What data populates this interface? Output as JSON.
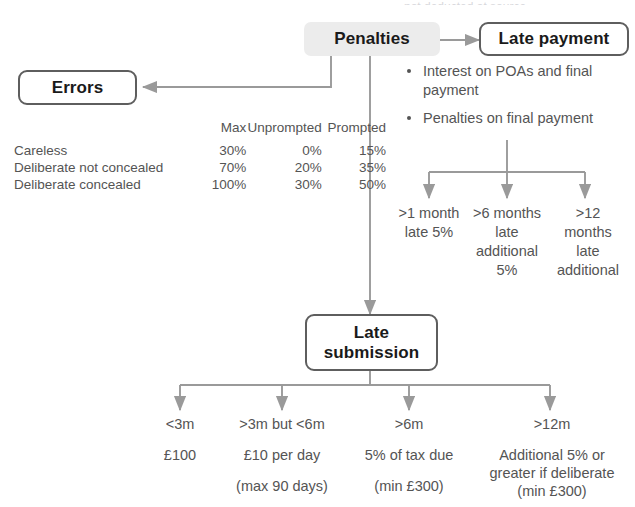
{
  "diagram": {
    "title": "Penalties",
    "cut_off_top_text": "not deducted at source",
    "nodes": {
      "penalties": {
        "label": "Penalties",
        "style": "filled",
        "fill": "#ececec"
      },
      "late_payment": {
        "label": "Late payment",
        "style": "outlined"
      },
      "errors": {
        "label": "Errors",
        "style": "outlined"
      },
      "late_submission": {
        "label": "Late\nsubmission",
        "line1": "Late",
        "line2": "submission",
        "style": "outlined"
      }
    },
    "late_payment_bullets": [
      "Interest on POAs and final payment",
      "Penalties on final payment"
    ],
    "late_payment_branches": [
      {
        "line1": ">1 month",
        "line2": "late 5%",
        "line3": "",
        "line4": ""
      },
      {
        "line1": ">6 months",
        "line2": "late",
        "line3": "additional",
        "line4": "5%"
      },
      {
        "line1": ">12",
        "line2": "months",
        "line3": "late",
        "line4": "additional"
      }
    ],
    "errors_table": {
      "columns": [
        "",
        "Max",
        "Unprompted",
        "Prompted"
      ],
      "rows": [
        {
          "label": "Careless",
          "max": "30%",
          "unprompted": "0%",
          "prompted": "15%"
        },
        {
          "label": "Deliberate not concealed",
          "max": "70%",
          "unprompted": "20%",
          "prompted": "35%"
        },
        {
          "label": "Deliberate concealed",
          "max": "100%",
          "unprompted": "30%",
          "prompted": "50%"
        }
      ]
    },
    "late_submission_branches": [
      {
        "period": "<3m",
        "amount": "£100",
        "note": ""
      },
      {
        "period": ">3m but <6m",
        "amount": "£10 per day",
        "note": "(max 90 days)"
      },
      {
        "period": ">6m",
        "amount": "5% of tax due",
        "note": "(min £300)"
      },
      {
        "period": ">12m",
        "amount": "Additional 5% or greater if deliberate",
        "note": "(min £300)"
      }
    ]
  },
  "colors": {
    "line": "#9a9a9a",
    "box_border": "#5e5e5e",
    "text": "#545454",
    "heading_text": "#1a1a1a",
    "highlight_fill": "#ececec",
    "background": "#ffffff"
  }
}
